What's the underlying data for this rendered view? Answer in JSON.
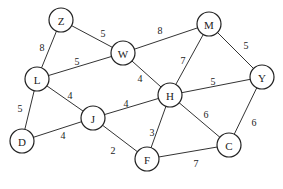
{
  "nodes": [
    {
      "id": "Z",
      "x": 61,
      "y": 20
    },
    {
      "id": "W",
      "x": 123,
      "y": 53
    },
    {
      "id": "M",
      "x": 209,
      "y": 24
    },
    {
      "id": "L",
      "x": 37,
      "y": 79
    },
    {
      "id": "H",
      "x": 170,
      "y": 95
    },
    {
      "id": "Y",
      "x": 262,
      "y": 77
    },
    {
      "id": "D",
      "x": 22,
      "y": 141
    },
    {
      "id": "J",
      "x": 93,
      "y": 118
    },
    {
      "id": "F",
      "x": 147,
      "y": 159
    },
    {
      "id": "C",
      "x": 229,
      "y": 145
    }
  ],
  "edges": [
    {
      "from": "Z",
      "to": "W",
      "weight": "5",
      "lx": 103,
      "ly": 33
    },
    {
      "from": "Z",
      "to": "L",
      "weight": "8",
      "lx": 42,
      "ly": 47
    },
    {
      "from": "L",
      "to": "W",
      "weight": "5",
      "lx": 77,
      "ly": 61
    },
    {
      "from": "W",
      "to": "M",
      "weight": "8",
      "lx": 160,
      "ly": 30
    },
    {
      "from": "W",
      "to": "H",
      "weight": "4",
      "lx": 140,
      "ly": 78
    },
    {
      "from": "M",
      "to": "H",
      "weight": "7",
      "lx": 183,
      "ly": 60
    },
    {
      "from": "M",
      "to": "Y",
      "weight": "5",
      "lx": 246,
      "ly": 45
    },
    {
      "from": "H",
      "to": "Y",
      "weight": "5",
      "lx": 213,
      "ly": 81
    },
    {
      "from": "L",
      "to": "J",
      "weight": "4",
      "lx": 70,
      "ly": 95
    },
    {
      "from": "L",
      "to": "D",
      "weight": "5",
      "lx": 20,
      "ly": 108
    },
    {
      "from": "D",
      "to": "J",
      "weight": "4",
      "lx": 63,
      "ly": 135
    },
    {
      "from": "J",
      "to": "H",
      "weight": "4",
      "lx": 126,
      "ly": 103
    },
    {
      "from": "J",
      "to": "F",
      "weight": "2",
      "lx": 113,
      "ly": 150
    },
    {
      "from": "H",
      "to": "F",
      "weight": "3",
      "lx": 152,
      "ly": 132
    },
    {
      "from": "H",
      "to": "C",
      "weight": "6",
      "lx": 206,
      "ly": 114
    },
    {
      "from": "Y",
      "to": "C",
      "weight": "6",
      "lx": 254,
      "ly": 122
    },
    {
      "from": "F",
      "to": "C",
      "weight": "7",
      "lx": 196,
      "ly": 163
    }
  ],
  "node_radius": 12
}
